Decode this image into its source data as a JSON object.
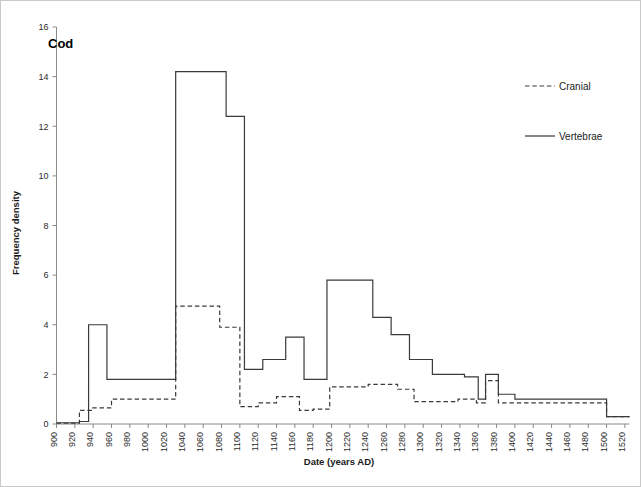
{
  "panel": {
    "title": "Cod"
  },
  "axes": {
    "x_title": "Date (years AD)",
    "y_title": "Frequency density",
    "x_ticks": [
      900,
      920,
      940,
      960,
      980,
      1000,
      1020,
      1040,
      1060,
      1080,
      1100,
      1120,
      1140,
      1160,
      1180,
      1200,
      1220,
      1240,
      1260,
      1280,
      1300,
      1320,
      1340,
      1360,
      1380,
      1400,
      1420,
      1440,
      1460,
      1480,
      1500,
      1520
    ],
    "y_ticks": [
      0,
      2,
      4,
      6,
      8,
      10,
      12,
      14,
      16
    ]
  },
  "legend": {
    "position": "top-right",
    "entries": [
      {
        "label": "Cranial",
        "style": "dashed"
      },
      {
        "label": "Vertebrae",
        "style": "solid"
      }
    ]
  },
  "colors": {
    "line": "#3a3a3a",
    "axis": "#8a8a8a",
    "text": "#1a1a1a",
    "background": "#ffffff",
    "border": "#c9c9c9"
  },
  "chart_data": {
    "type": "line",
    "subtype": "step",
    "title": "Cod",
    "xlabel": "Date (years AD)",
    "ylabel": "Frequency density",
    "xlim": [
      900,
      1525
    ],
    "ylim": [
      0,
      16
    ],
    "grid": false,
    "legend_position": "top-right",
    "series": [
      {
        "name": "Vertebrae",
        "style": "solid",
        "steps": [
          {
            "x0": 900,
            "x1": 925,
            "y": 0.05
          },
          {
            "x0": 925,
            "x1": 935,
            "y": 0.1
          },
          {
            "x0": 935,
            "x1": 955,
            "y": 4.0
          },
          {
            "x0": 955,
            "x1": 1030,
            "y": 1.8
          },
          {
            "x0": 1030,
            "x1": 1085,
            "y": 14.2
          },
          {
            "x0": 1085,
            "x1": 1105,
            "y": 12.4
          },
          {
            "x0": 1105,
            "x1": 1125,
            "y": 2.2
          },
          {
            "x0": 1125,
            "x1": 1150,
            "y": 2.6
          },
          {
            "x0": 1150,
            "x1": 1170,
            "y": 3.5
          },
          {
            "x0": 1170,
            "x1": 1195,
            "y": 1.8
          },
          {
            "x0": 1195,
            "x1": 1245,
            "y": 5.8
          },
          {
            "x0": 1245,
            "x1": 1265,
            "y": 4.3
          },
          {
            "x0": 1265,
            "x1": 1285,
            "y": 3.6
          },
          {
            "x0": 1285,
            "x1": 1310,
            "y": 2.6
          },
          {
            "x0": 1310,
            "x1": 1345,
            "y": 2.0
          },
          {
            "x0": 1345,
            "x1": 1360,
            "y": 1.9
          },
          {
            "x0": 1360,
            "x1": 1368,
            "y": 1.0
          },
          {
            "x0": 1368,
            "x1": 1382,
            "y": 2.0
          },
          {
            "x0": 1382,
            "x1": 1400,
            "y": 1.2
          },
          {
            "x0": 1400,
            "x1": 1500,
            "y": 1.0
          },
          {
            "x0": 1500,
            "x1": 1525,
            "y": 0.3
          }
        ]
      },
      {
        "name": "Cranial",
        "style": "dashed",
        "steps": [
          {
            "x0": 900,
            "x1": 925,
            "y": 0.03
          },
          {
            "x0": 925,
            "x1": 938,
            "y": 0.55
          },
          {
            "x0": 938,
            "x1": 960,
            "y": 0.65
          },
          {
            "x0": 960,
            "x1": 1030,
            "y": 1.0
          },
          {
            "x0": 1030,
            "x1": 1078,
            "y": 4.75
          },
          {
            "x0": 1078,
            "x1": 1100,
            "y": 3.9
          },
          {
            "x0": 1100,
            "x1": 1120,
            "y": 0.7
          },
          {
            "x0": 1120,
            "x1": 1140,
            "y": 0.85
          },
          {
            "x0": 1140,
            "x1": 1165,
            "y": 1.1
          },
          {
            "x0": 1165,
            "x1": 1180,
            "y": 0.55
          },
          {
            "x0": 1180,
            "x1": 1198,
            "y": 0.6
          },
          {
            "x0": 1198,
            "x1": 1240,
            "y": 1.5
          },
          {
            "x0": 1240,
            "x1": 1272,
            "y": 1.6
          },
          {
            "x0": 1272,
            "x1": 1290,
            "y": 1.4
          },
          {
            "x0": 1290,
            "x1": 1338,
            "y": 0.9
          },
          {
            "x0": 1338,
            "x1": 1358,
            "y": 1.0
          },
          {
            "x0": 1358,
            "x1": 1368,
            "y": 0.85
          },
          {
            "x0": 1368,
            "x1": 1382,
            "y": 1.75
          },
          {
            "x0": 1382,
            "x1": 1500,
            "y": 0.85
          },
          {
            "x0": 1500,
            "x1": 1525,
            "y": 0.3
          }
        ]
      }
    ]
  }
}
